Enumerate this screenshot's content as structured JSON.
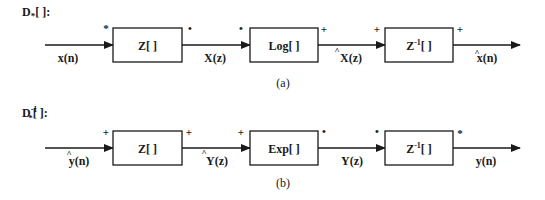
{
  "diagram": {
    "panel_a": {
      "title": "D",
      "title_sub": "*",
      "title_rest": "[ ]:",
      "caption": "(a)",
      "blocks": [
        {
          "label": "Z[ ]",
          "in_mark": "*",
          "out_mark": "•"
        },
        {
          "label": "Log[ ]",
          "in_mark": "•",
          "out_mark": "+"
        },
        {
          "label_main": "Z",
          "label_sup": "-1",
          "label_rest": "[ ]",
          "in_mark": "+",
          "out_mark": "+"
        }
      ],
      "signals": [
        {
          "label": "x(n)",
          "hat": false
        },
        {
          "label": "X(z)",
          "hat": false
        },
        {
          "label": "X(z)",
          "hat": true
        },
        {
          "label": "x(n)",
          "hat": true
        }
      ]
    },
    "panel_b": {
      "title": "D",
      "title_sup": "-1",
      "title_sub": "*",
      "title_rest": "[ ]:",
      "caption": "(b)",
      "blocks": [
        {
          "label": "Z[ ]",
          "in_mark": "+",
          "out_mark": "+"
        },
        {
          "label": "Exp[ ]",
          "in_mark": "+",
          "out_mark": "•"
        },
        {
          "label_main": "Z",
          "label_sup": "-1",
          "label_rest": "[ ]",
          "in_mark": "•",
          "out_mark": "*"
        }
      ],
      "signals": [
        {
          "label": "y(n)",
          "hat": true
        },
        {
          "label": "Y(z)",
          "hat": true
        },
        {
          "label": "Y(z)",
          "hat": false
        },
        {
          "label": "y(n)",
          "hat": false
        }
      ]
    },
    "hat_glyph": "^"
  }
}
